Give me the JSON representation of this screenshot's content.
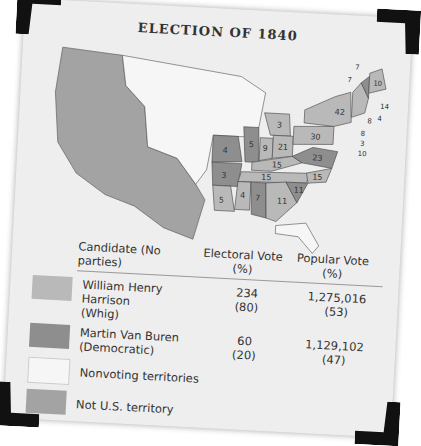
{
  "title": "ELECTION OF 1840",
  "colors": {
    "whig": "#b9b9b9",
    "democratic": "#8e8e8e",
    "nonvoting": "#f4f4f4",
    "not_us": "#a3a3a3",
    "card": "#eeeeee",
    "corner": "#111111"
  },
  "legend": {
    "headers": {
      "candidate": "Candidate (No parties)",
      "electoral": "Electoral Vote (%)",
      "popular": "Popular Vote (%)"
    },
    "rows": [
      {
        "name": "William Henry Harrison",
        "party": "(Whig)",
        "electoral": "234",
        "electoral_pct": "(80)",
        "popular": "1,275,016",
        "popular_pct": "(53)"
      },
      {
        "name": "Martin Van Buren",
        "party": "(Democratic)",
        "electoral": "60",
        "electoral_pct": "(20)",
        "popular": "1,129,102",
        "popular_pct": "(47)"
      }
    ],
    "nonvoting_label": "Nonvoting territories",
    "not_us_label": "Not U.S. territory"
  },
  "map_labels": [
    {
      "state": "ME",
      "votes": "10",
      "party": "whig"
    },
    {
      "state": "NH",
      "votes": "7",
      "party": "democratic"
    },
    {
      "state": "VT",
      "votes": "7",
      "party": "whig"
    },
    {
      "state": "MA",
      "votes": "14",
      "party": "whig"
    },
    {
      "state": "RI",
      "votes": "4",
      "party": "whig"
    },
    {
      "state": "CT",
      "votes": "8",
      "party": "whig"
    },
    {
      "state": "NY",
      "votes": "42",
      "party": "whig"
    },
    {
      "state": "NJ",
      "votes": "8",
      "party": "whig"
    },
    {
      "state": "DE",
      "votes": "3",
      "party": "whig"
    },
    {
      "state": "MD",
      "votes": "10",
      "party": "whig"
    },
    {
      "state": "PA",
      "votes": "30",
      "party": "whig"
    },
    {
      "state": "MI",
      "votes": "3",
      "party": "whig"
    },
    {
      "state": "OH",
      "votes": "21",
      "party": "whig"
    },
    {
      "state": "IN",
      "votes": "9",
      "party": "whig"
    },
    {
      "state": "IL",
      "votes": "5",
      "party": "democratic"
    },
    {
      "state": "MO",
      "votes": "4",
      "party": "democratic"
    },
    {
      "state": "AR",
      "votes": "3",
      "party": "democratic"
    },
    {
      "state": "LA",
      "votes": "5",
      "party": "whig"
    },
    {
      "state": "MS",
      "votes": "4",
      "party": "whig"
    },
    {
      "state": "AL",
      "votes": "7",
      "party": "democratic"
    },
    {
      "state": "GA",
      "votes": "11",
      "party": "whig"
    },
    {
      "state": "SC",
      "votes": "11",
      "party": "democratic"
    },
    {
      "state": "NC",
      "votes": "15",
      "party": "whig"
    },
    {
      "state": "VA",
      "votes": "23",
      "party": "democratic"
    },
    {
      "state": "KY",
      "votes": "15",
      "party": "whig"
    },
    {
      "state": "TN",
      "votes": "15",
      "party": "whig"
    }
  ]
}
